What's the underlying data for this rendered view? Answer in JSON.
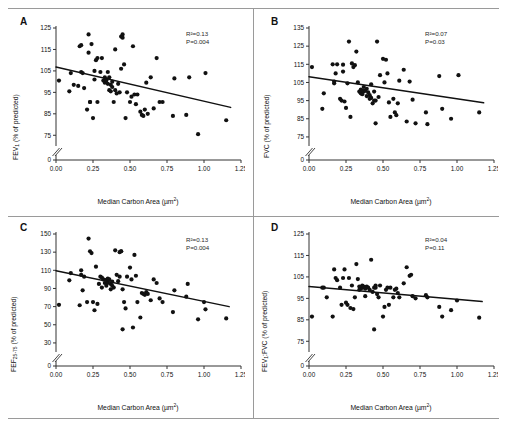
{
  "figure": {
    "type": "multi-panel-scatter",
    "panels": 4,
    "layout": "2x2"
  },
  "chart_data": [
    {
      "type": "scatter",
      "panel": "A",
      "title": "",
      "xlabel": "Median Carbon Area (µm²)",
      "ylabel": "FEV₁ (% of predicted)",
      "xlim": [
        0.0,
        1.25
      ],
      "ylim": [
        70,
        125
      ],
      "xticks": [
        "0.00",
        "0.25",
        "0.50",
        "0.75",
        "1.00",
        "1.25"
      ],
      "xtick_values": [
        0.0,
        0.25,
        0.5,
        0.75,
        1.0,
        1.25
      ],
      "yticks": [
        "0",
        "75",
        "85",
        "95",
        "105",
        "115",
        "125"
      ],
      "ytick_values": [
        70,
        75,
        85,
        95,
        105,
        115,
        125
      ],
      "axis_break": true,
      "grid": false,
      "legend": null,
      "annotations": {
        "r_squared": "R²=0.13",
        "p_value": "P=0.004"
      },
      "regression": {
        "x0": 0.0,
        "y0": 106.8,
        "x1": 1.18,
        "y1": 88.0
      },
      "x": [
        0.02,
        0.09,
        0.1,
        0.12,
        0.15,
        0.16,
        0.17,
        0.17,
        0.18,
        0.19,
        0.21,
        0.22,
        0.22,
        0.23,
        0.23,
        0.24,
        0.25,
        0.26,
        0.26,
        0.27,
        0.28,
        0.28,
        0.3,
        0.31,
        0.32,
        0.33,
        0.33,
        0.34,
        0.34,
        0.35,
        0.35,
        0.36,
        0.36,
        0.37,
        0.37,
        0.38,
        0.38,
        0.39,
        0.4,
        0.4,
        0.41,
        0.42,
        0.43,
        0.44,
        0.44,
        0.45,
        0.45,
        0.46,
        0.47,
        0.48,
        0.5,
        0.51,
        0.52,
        0.53,
        0.54,
        0.55,
        0.57,
        0.58,
        0.59,
        0.6,
        0.61,
        0.62,
        0.64,
        0.66,
        0.68,
        0.7,
        0.72,
        0.79,
        0.8,
        0.88,
        0.9,
        0.96,
        1.01,
        1.15
      ],
      "y": [
        100.5,
        95.5,
        104.0,
        98.5,
        98.0,
        116.5,
        117.0,
        104.5,
        104.0,
        97.0,
        87.0,
        122.0,
        113.5,
        90.5,
        90.5,
        117.5,
        83.0,
        101.0,
        105.0,
        110.0,
        90.5,
        111.0,
        104.5,
        111.0,
        100.5,
        102.0,
        99.5,
        100.5,
        101.0,
        104.5,
        99.0,
        102.0,
        96.0,
        98.5,
        95.5,
        100.0,
        97.5,
        90.5,
        115.0,
        96.0,
        94.5,
        99.0,
        95.0,
        121.0,
        106.0,
        122.0,
        120.5,
        108.0,
        83.0,
        95.0,
        90.5,
        93.0,
        116.5,
        94.0,
        89.5,
        94.0,
        86.0,
        84.5,
        84.0,
        87.0,
        99.5,
        85.0,
        102.0,
        87.5,
        111.0,
        90.5,
        90.5,
        84.0,
        101.5,
        84.5,
        102.0,
        75.5,
        104.0,
        82.0
      ]
    },
    {
      "type": "scatter",
      "panel": "B",
      "title": "",
      "xlabel": "Median Carbon Area (µm²)",
      "ylabel": "FVC (% of predicted)",
      "xlim": [
        0.0,
        1.25
      ],
      "ylim": [
        70,
        135
      ],
      "xticks": [
        "0.00",
        "0.25",
        "0.50",
        "0.75",
        "1.00",
        "1.25"
      ],
      "xtick_values": [
        0.0,
        0.25,
        0.5,
        0.75,
        1.0,
        1.25
      ],
      "yticks": [
        "0",
        "75",
        "85",
        "95",
        "105",
        "115",
        "125",
        "135"
      ],
      "ytick_values": [
        70,
        75,
        85,
        95,
        105,
        115,
        125,
        135
      ],
      "axis_break": true,
      "grid": false,
      "legend": null,
      "annotations": {
        "r_squared": "R²=0.07",
        "p_value": "P=0.03"
      },
      "regression": {
        "x0": 0.0,
        "y0": 108.2,
        "x1": 1.18,
        "y1": 93.8
      },
      "x": [
        0.02,
        0.09,
        0.1,
        0.16,
        0.17,
        0.17,
        0.18,
        0.19,
        0.21,
        0.22,
        0.23,
        0.23,
        0.24,
        0.25,
        0.26,
        0.27,
        0.28,
        0.29,
        0.3,
        0.31,
        0.32,
        0.33,
        0.34,
        0.35,
        0.35,
        0.36,
        0.36,
        0.37,
        0.37,
        0.38,
        0.39,
        0.39,
        0.4,
        0.41,
        0.41,
        0.42,
        0.42,
        0.43,
        0.44,
        0.44,
        0.45,
        0.45,
        0.46,
        0.47,
        0.48,
        0.5,
        0.51,
        0.52,
        0.53,
        0.54,
        0.55,
        0.57,
        0.58,
        0.59,
        0.6,
        0.61,
        0.64,
        0.66,
        0.68,
        0.7,
        0.72,
        0.79,
        0.8,
        0.88,
        0.9,
        0.96,
        1.01,
        1.15
      ],
      "y": [
        113.5,
        90.5,
        99.0,
        115.0,
        105.5,
        104.5,
        110.0,
        115.0,
        96.0,
        95.0,
        111.0,
        114.8,
        94.5,
        91.0,
        104.5,
        127.5,
        86.0,
        115.5,
        113.5,
        114.5,
        122.0,
        105.0,
        100.0,
        99.0,
        101.0,
        100.5,
        98.5,
        102.5,
        100.0,
        100.5,
        97.5,
        101.5,
        99.5,
        98.0,
        96.0,
        96.5,
        104.0,
        93.5,
        95.0,
        100.0,
        95.0,
        82.5,
        127.5,
        97.0,
        109.0,
        118.0,
        105.0,
        117.5,
        110.0,
        94.0,
        86.0,
        96.0,
        88.5,
        87.0,
        93.5,
        106.0,
        112.0,
        83.5,
        105.5,
        95.5,
        82.5,
        88.5,
        82.0,
        108.5,
        90.5,
        85.0,
        109.0,
        88.5
      ]
    },
    {
      "type": "scatter",
      "panel": "C",
      "title": "",
      "xlabel": "Median Carbon Area (µm²)",
      "ylabel": "FEF₂₅₋₇₅ (% of predicted)",
      "xlim": [
        0.0,
        1.25
      ],
      "ylim": [
        20,
        150
      ],
      "xticks": [
        "0.00",
        "0.25",
        "0.50",
        "0.75",
        "1.00",
        "1.25"
      ],
      "xtick_values": [
        0.0,
        0.25,
        0.5,
        0.75,
        1.0,
        1.25
      ],
      "yticks": [
        "0",
        "30",
        "50",
        "70",
        "90",
        "110",
        "130",
        "150"
      ],
      "ytick_values": [
        20,
        30,
        50,
        70,
        90,
        110,
        130,
        150
      ],
      "axis_break": true,
      "grid": false,
      "legend": null,
      "annotations": {
        "r_squared": "R²=0.13",
        "p_value": "P=0.004"
      },
      "regression": {
        "x0": 0.0,
        "y0": 109.5,
        "x1": 1.17,
        "y1": 70.0
      },
      "x": [
        0.02,
        0.09,
        0.1,
        0.16,
        0.17,
        0.17,
        0.18,
        0.19,
        0.21,
        0.22,
        0.23,
        0.24,
        0.25,
        0.26,
        0.27,
        0.28,
        0.29,
        0.3,
        0.31,
        0.31,
        0.32,
        0.33,
        0.34,
        0.34,
        0.35,
        0.35,
        0.36,
        0.37,
        0.37,
        0.38,
        0.38,
        0.39,
        0.4,
        0.41,
        0.42,
        0.43,
        0.43,
        0.44,
        0.44,
        0.45,
        0.45,
        0.46,
        0.47,
        0.48,
        0.5,
        0.51,
        0.52,
        0.53,
        0.54,
        0.55,
        0.57,
        0.58,
        0.59,
        0.6,
        0.61,
        0.62,
        0.64,
        0.66,
        0.68,
        0.7,
        0.72,
        0.79,
        0.8,
        0.88,
        0.89,
        0.96,
        1.0,
        1.01,
        1.15
      ],
      "y": [
        72.0,
        99.0,
        107.0,
        71.5,
        110.0,
        105.0,
        88.0,
        103.0,
        75.0,
        145.0,
        131.0,
        129.0,
        75.0,
        66.0,
        114.0,
        73.0,
        95.0,
        103.0,
        102.0,
        91.0,
        100.0,
        96.0,
        99.5,
        93.0,
        96.0,
        101.0,
        100.0,
        89.0,
        95.0,
        97.5,
        93.0,
        91.0,
        132.0,
        105.0,
        98.0,
        130.0,
        103.0,
        131.0,
        131.0,
        45.0,
        89.0,
        75.0,
        68.0,
        103.0,
        113.0,
        100.0,
        47.0,
        127.0,
        104.0,
        75.0,
        58.0,
        85.0,
        84.0,
        83.0,
        86.0,
        84.0,
        77.0,
        100.0,
        96.0,
        79.0,
        75.0,
        64.0,
        88.0,
        81.0,
        95.0,
        56.0,
        75.0,
        67.0,
        57.0
      ]
    },
    {
      "type": "scatter",
      "panel": "D",
      "title": "",
      "xlabel": "Median Carbon Area (µm²)",
      "ylabel": "FEV₁:FVC (% of predicted)",
      "xlim": [
        0.0,
        1.25
      ],
      "ylim": [
        70,
        125
      ],
      "xticks": [
        "0.00",
        "0.25",
        "0.50",
        "0.75",
        "1.00",
        "1.25"
      ],
      "xtick_values": [
        0.0,
        0.25,
        0.5,
        0.75,
        1.0,
        1.25
      ],
      "yticks": [
        "0",
        "75",
        "85",
        "95",
        "105",
        "115",
        "125"
      ],
      "ytick_values": [
        70,
        75,
        85,
        95,
        105,
        115,
        125
      ],
      "axis_break": true,
      "grid": false,
      "legend": null,
      "annotations": {
        "r_squared": "R²=0.04",
        "p_value": "P=0.11"
      },
      "regression": {
        "x0": 0.0,
        "y0": 100.5,
        "x1": 1.17,
        "y1": 93.5
      },
      "x": [
        0.02,
        0.09,
        0.1,
        0.12,
        0.16,
        0.17,
        0.18,
        0.19,
        0.21,
        0.22,
        0.23,
        0.24,
        0.25,
        0.26,
        0.27,
        0.28,
        0.29,
        0.3,
        0.31,
        0.32,
        0.33,
        0.34,
        0.34,
        0.35,
        0.36,
        0.36,
        0.37,
        0.38,
        0.38,
        0.39,
        0.4,
        0.41,
        0.42,
        0.43,
        0.44,
        0.44,
        0.45,
        0.45,
        0.46,
        0.47,
        0.48,
        0.5,
        0.51,
        0.52,
        0.53,
        0.54,
        0.55,
        0.57,
        0.58,
        0.59,
        0.6,
        0.61,
        0.64,
        0.66,
        0.68,
        0.69,
        0.7,
        0.72,
        0.79,
        0.8,
        0.88,
        0.9,
        0.96,
        1.0,
        1.15
      ],
      "y": [
        86.5,
        100.0,
        100.0,
        95.5,
        86.5,
        108.5,
        104.5,
        103.5,
        100.0,
        92.0,
        104.5,
        108.5,
        93.0,
        92.0,
        104.5,
        90.5,
        101.0,
        90.0,
        95.5,
        111.0,
        104.0,
        99.0,
        100.5,
        99.5,
        100.0,
        101.0,
        100.5,
        99.5,
        96.0,
        100.5,
        100.0,
        99.0,
        113.0,
        98.0,
        100.0,
        80.5,
        100.0,
        101.0,
        97.0,
        95.5,
        101.0,
        86.5,
        91.0,
        99.0,
        100.0,
        92.0,
        100.0,
        95.5,
        99.0,
        99.5,
        97.5,
        95.5,
        102.0,
        109.5,
        105.5,
        106.0,
        96.0,
        95.0,
        96.5,
        95.5,
        91.0,
        86.5,
        89.5,
        94.0,
        86.0
      ]
    }
  ]
}
